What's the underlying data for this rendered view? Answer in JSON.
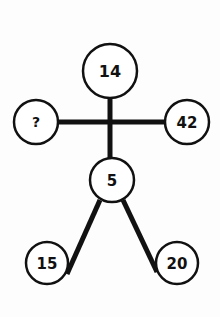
{
  "diagram": {
    "type": "number-puzzle-figure",
    "colors": {
      "background": "#fdfdfd",
      "stroke": "#111111",
      "node_fill": "#ffffff"
    },
    "nodes": [
      {
        "id": "head",
        "label": "14",
        "cx": 110,
        "cy": 71,
        "r": 27
      },
      {
        "id": "left-hand",
        "label": "?",
        "cx": 36,
        "cy": 122,
        "r": 22
      },
      {
        "id": "right-hand",
        "label": "42",
        "cx": 187,
        "cy": 122,
        "r": 22
      },
      {
        "id": "waist",
        "label": "5",
        "cx": 112,
        "cy": 180,
        "r": 22
      },
      {
        "id": "left-foot",
        "label": "15",
        "cx": 47,
        "cy": 263,
        "r": 21
      },
      {
        "id": "right-foot",
        "label": "20",
        "cx": 177,
        "cy": 263,
        "r": 21
      }
    ]
  }
}
